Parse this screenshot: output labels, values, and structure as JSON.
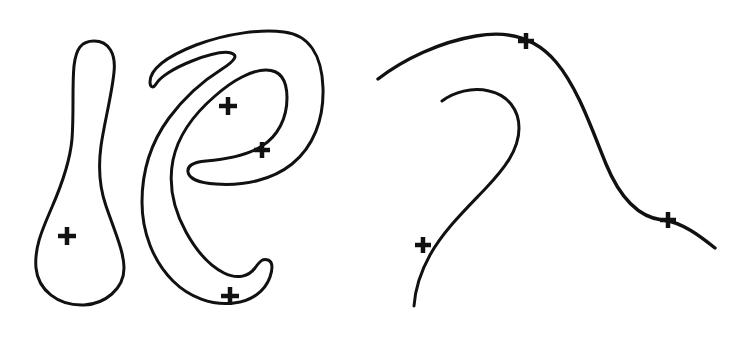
{
  "figure": {
    "background_color": "#ffffff",
    "ink_color": "#111111",
    "width": 741,
    "height": 340,
    "marker_glyph": "+",
    "marker_count": 7,
    "shape_count": 4
  },
  "shapes": [
    {
      "id": "left-teardrop",
      "name": "left-closed-teardrop-outline",
      "kind": "closed-outline",
      "stroke_width": 3.0,
      "closed": true,
      "d": "M 94 41 C 109 41 116 54 114 72 C 112 94 104 124 101 146 C 98 168 99 186 106 206 C 115 232 124 252 124 268 C 124 289 105 304 84 305 C 58 306 38 290 36 268 C 34 246 44 226 52 207 C 62 184 70 162 72 139 C 74 113 72 86 74 66 C 76 49 81 41 94 41 Z"
    },
    {
      "id": "middle-ribbon",
      "name": "middle-s-ribbon-outline",
      "kind": "closed-outline",
      "stroke_width": 3.0,
      "closed": true,
      "d": "M 150 82 C 150 68 168 56 196 45 C 228 33 262 29 284 32 C 309 35 322 55 323 88 C 324 120 313 147 292 164 C 272 180 244 186 216 184 C 198 183 189 178 188 172 C 187 166 193 162 206 161 C 228 159 248 155 262 146 C 278 136 287 118 287 98 C 287 80 280 70 266 70 C 252 70 233 80 215 96 C 194 114 178 136 173 160 C 168 185 174 210 186 232 C 197 252 210 266 224 273 C 238 280 249 276 255 268 C 260 261 263 258 268 260 C 273 262 273 268 270 277 C 265 291 252 301 234 303 C 212 306 189 297 173 281 C 153 261 142 232 142 202 C 142 170 152 141 169 118 C 186 95 206 79 222 69 C 236 60 238 55 231 53 C 224 51 210 54 192 61 C 174 68 160 77 156 84 C 153 89 150 87 150 82 Z"
    },
    {
      "id": "right-big-arc",
      "name": "right-open-s-curve",
      "kind": "open-curve",
      "stroke_width": 3.4,
      "closed": false,
      "d": "M 378 79 C 404 59 440 42 476 36 C 510 30 536 38 556 62 C 578 88 592 130 606 164 C 620 198 638 217 662 220 C 682 222 700 236 715 248"
    },
    {
      "id": "right-hook",
      "name": "right-open-hook-curve",
      "kind": "open-curve",
      "stroke_width": 3.0,
      "closed": false,
      "d": "M 442 101 C 454 92 472 87 489 91 C 508 95 519 110 519 128 C 519 150 504 169 486 188 C 466 209 444 230 430 255 C 420 273 415 291 414 306"
    }
  ],
  "markers": [
    {
      "id": "m1",
      "name": "cross-marker-left-blob",
      "x": 67,
      "y": 236,
      "arm": 9,
      "thickness": 4.5,
      "shape_id": "left-teardrop"
    },
    {
      "id": "m2",
      "name": "cross-marker-middle-upper",
      "x": 228,
      "y": 106,
      "arm": 9,
      "thickness": 4.5,
      "shape_id": "middle-ribbon"
    },
    {
      "id": "m3",
      "name": "cross-marker-middle-right",
      "x": 262,
      "y": 150,
      "arm": 8,
      "thickness": 4.5,
      "shape_id": "middle-ribbon"
    },
    {
      "id": "m4",
      "name": "cross-marker-middle-lower",
      "x": 230,
      "y": 296,
      "arm": 9,
      "thickness": 4.5,
      "shape_id": "middle-ribbon"
    },
    {
      "id": "m5",
      "name": "cross-marker-right-arc-top",
      "x": 526,
      "y": 41,
      "arm": 8,
      "thickness": 4.5,
      "shape_id": "right-big-arc"
    },
    {
      "id": "m6",
      "name": "cross-marker-right-arc-lower",
      "x": 668,
      "y": 220,
      "arm": 8,
      "thickness": 4.5,
      "shape_id": "right-big-arc"
    },
    {
      "id": "m7",
      "name": "cross-marker-right-hook-bottom",
      "x": 423,
      "y": 245,
      "arm": 8,
      "thickness": 4.5,
      "shape_id": "right-hook"
    }
  ]
}
